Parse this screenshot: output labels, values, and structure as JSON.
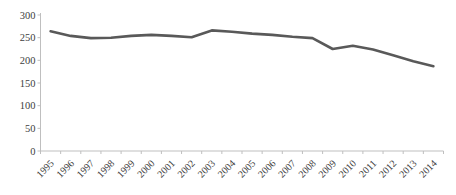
{
  "chart_data": {
    "type": "line",
    "title": "",
    "xlabel": "",
    "ylabel": "",
    "categories": [
      "1995",
      "1996",
      "1997",
      "1998",
      "1999",
      "2000",
      "2001",
      "2002",
      "2003",
      "2004",
      "2005",
      "2006",
      "2007",
      "2008",
      "2009",
      "2010",
      "2011",
      "2012",
      "2013",
      "2014"
    ],
    "series": [
      {
        "name": "series-1",
        "values": [
          264,
          254,
          249,
          250,
          254,
          256,
          254,
          251,
          266,
          263,
          259,
          256,
          252,
          249,
          225,
          232,
          224,
          211,
          198,
          187
        ]
      }
    ],
    "ylim": [
      0,
      300
    ],
    "ytick_step": 50,
    "yticks": [
      0,
      50,
      100,
      150,
      200,
      250,
      300
    ],
    "grid": false,
    "legend": "none",
    "x_label_rotation_deg": 45,
    "colors": {
      "line": "#595959",
      "axis": "#bfbfbf",
      "tick_labels": "#404040",
      "background": "#ffffff"
    }
  }
}
